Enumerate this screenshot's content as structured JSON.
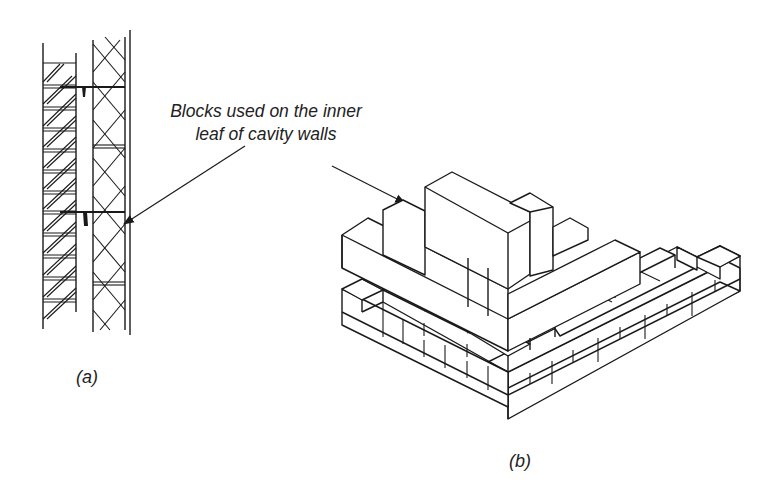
{
  "figure": {
    "callout": {
      "line1": "Blocks used on the inner",
      "line2": "leaf of cavity walls"
    },
    "panels": [
      {
        "id": "a",
        "label": "(a)",
        "description": "Section through cavity wall: hatched outer brick leaf, cavity with wall ties, cross-hatched inner block leaf"
      },
      {
        "id": "b",
        "label": "(b)",
        "description": "Isometric view of blockwork corner built on brick courses"
      }
    ],
    "colors": {
      "line": "#1a1a1a",
      "background": "#ffffff"
    }
  }
}
